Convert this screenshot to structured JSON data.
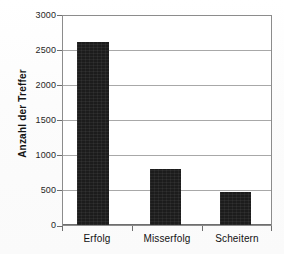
{
  "chart_data": {
    "type": "bar",
    "title": "",
    "xlabel": "",
    "ylabel": "Anzahl der Treffer",
    "categories": [
      "Erfolg",
      "Misserfolg",
      "Scheitern"
    ],
    "values": [
      2620,
      800,
      475
    ],
    "ylim": [
      0,
      3000
    ],
    "ytick_labels": [
      "3000",
      "2500",
      "2000",
      "1500",
      "1000",
      "500",
      "0"
    ],
    "ytick_values": [
      3000,
      2500,
      2000,
      1500,
      1000,
      500,
      0
    ],
    "ytick_step": 500,
    "grid": true,
    "grid_axis": "y",
    "legend": false,
    "legend_position": "none",
    "bar_color": "#1c1c1c",
    "gridline_color": "#a8a8a8",
    "axis_color": "#6e6e6e",
    "background_color": "#ffffff",
    "series": [
      {
        "name": "Anzahl der Treffer",
        "values": [
          2620,
          800,
          475
        ]
      }
    ]
  }
}
